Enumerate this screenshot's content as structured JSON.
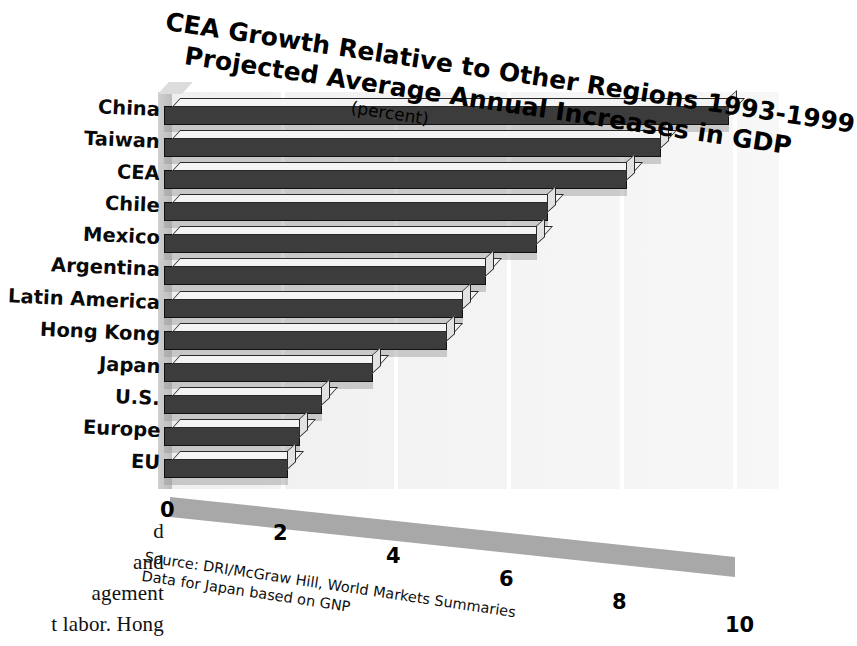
{
  "chart_data": {
    "type": "bar",
    "orientation": "horizontal",
    "title": "CEA Growth Relative to Other Regions 1993-1999",
    "title_line1": "CEA Growth Relative to Other Regions 1993-1999",
    "title_line2": "Projected Average Annual Increases in GDP",
    "subtitle": "(percent)",
    "xlabel": "",
    "ylabel": "",
    "xlim": [
      0,
      10
    ],
    "grid": true,
    "legend": "none",
    "xticks": [
      "0",
      "2",
      "4",
      "6",
      "8",
      "10"
    ],
    "xtick_values": [
      0,
      2,
      4,
      6,
      8,
      10
    ],
    "categories": [
      "China",
      "Taiwan",
      "CEA",
      "Chile",
      "Mexico",
      "Argentina",
      "Latin America",
      "Hong Kong",
      "Japan",
      "U.S.",
      "Europe",
      "EU"
    ],
    "values": [
      10.0,
      8.8,
      8.2,
      6.8,
      6.6,
      5.7,
      5.3,
      5.0,
      3.7,
      2.8,
      2.4,
      2.2
    ],
    "source": {
      "line1": "Source: DRI/McGraw Hill, World Markets Summaries",
      "line2": "Data for Japan based on GNP"
    },
    "colors": {
      "bar_face": "#3c3c3c",
      "bar_top": "#f4f4f4",
      "bar_end": "#e2e2e2",
      "plot_background": "#f2f2f2",
      "floor": "#a8a8a8",
      "side_wall": "#c4c4c4",
      "text": "#000000"
    }
  },
  "scan_text": {
    "line1": "d",
    "line2": "and",
    "line3": "agement",
    "line4": "t labor. Hong"
  }
}
